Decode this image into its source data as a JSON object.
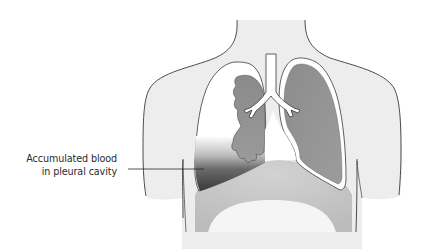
{
  "figure": {
    "annotations": [
      {
        "id": "accumulated-blood",
        "lines": [
          "Accumulated blood",
          "in pleural cavity"
        ]
      }
    ],
    "structures": [
      "torso-outline",
      "trachea",
      "bronchi",
      "collapsed-right-lung",
      "normal-left-lung",
      "pleural-cavity",
      "accumulated-blood",
      "diaphragm"
    ],
    "colors": {
      "body_fill": "#ededed",
      "outline": "#3a3a3a",
      "lung_fill": "#8f8f8f",
      "pleura": "#ffffff",
      "blood_dark": "#3e3e3e",
      "diaphragm": "#c9c9c9",
      "abdomen_light": "#f4f4f4"
    }
  }
}
